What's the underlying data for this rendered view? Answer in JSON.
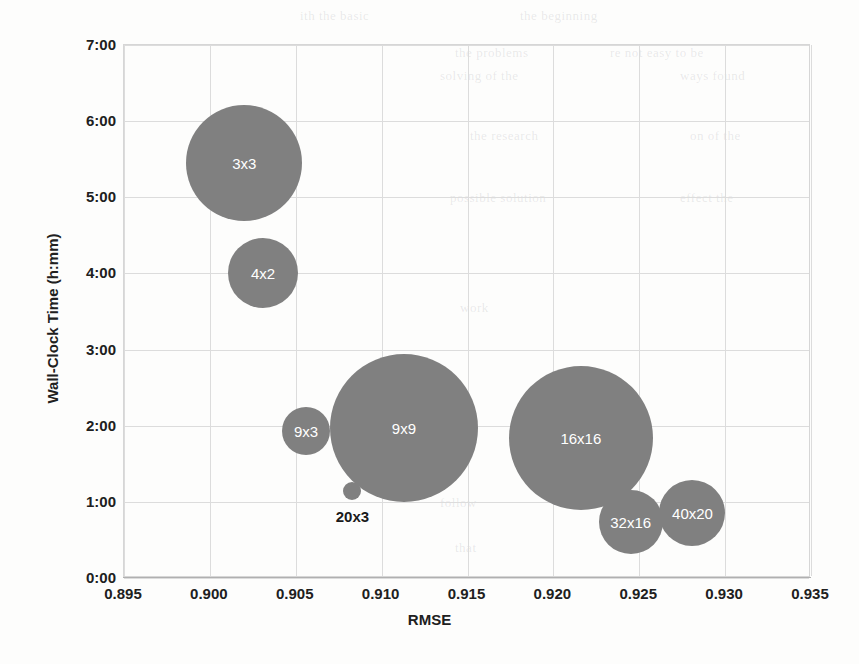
{
  "chart_data": {
    "type": "scatter",
    "subtype": "bubble",
    "title": "",
    "xlabel": "RMSE",
    "ylabel": "Wall-Clock Time (h:mm)",
    "xlim": [
      0.895,
      0.935
    ],
    "ylim": [
      0,
      7
    ],
    "xticks": [
      "0.895",
      "0.900",
      "0.905",
      "0.910",
      "0.915",
      "0.920",
      "0.925",
      "0.930",
      "0.935"
    ],
    "xtick_values": [
      0.895,
      0.9,
      0.905,
      0.91,
      0.915,
      0.92,
      0.925,
      0.93,
      0.935
    ],
    "yticks": [
      "0:00",
      "1:00",
      "2:00",
      "3:00",
      "4:00",
      "5:00",
      "6:00",
      "7:00"
    ],
    "ytick_values": [
      0,
      1,
      2,
      3,
      4,
      5,
      6,
      7
    ],
    "grid": true,
    "legend": "none",
    "bubble_color": "#808080",
    "points": [
      {
        "label": "3x3",
        "x": 0.902,
        "y": 5.45,
        "y_time": "5:27",
        "r": 58,
        "label_pos": "inside"
      },
      {
        "label": "4x2",
        "x": 0.9031,
        "y": 4.01,
        "y_time": "4:01",
        "r": 35,
        "label_pos": "inside"
      },
      {
        "label": "9x3",
        "x": 0.9056,
        "y": 1.93,
        "y_time": "1:56",
        "r": 24,
        "label_pos": "inside"
      },
      {
        "label": "9x9",
        "x": 0.9113,
        "y": 1.97,
        "y_time": "1:58",
        "r": 74,
        "label_pos": "inside"
      },
      {
        "label": "20x3",
        "x": 0.9083,
        "y": 1.14,
        "y_time": "1:08",
        "r": 9,
        "label_pos": "below"
      },
      {
        "label": "16x16",
        "x": 0.9216,
        "y": 1.84,
        "y_time": "1:50",
        "r": 72,
        "label_pos": "inside"
      },
      {
        "label": "32x16",
        "x": 0.9245,
        "y": 0.74,
        "y_time": "0:44",
        "r": 32,
        "label_pos": "inside"
      },
      {
        "label": "40x20",
        "x": 0.9281,
        "y": 0.86,
        "y_time": "0:52",
        "r": 33,
        "label_pos": "inside"
      }
    ]
  },
  "bleed_text": [
    {
      "t": "the beginning",
      "x": 520,
      "y": 8
    },
    {
      "t": "ith the basic",
      "x": 300,
      "y": 8
    },
    {
      "t": "the problems",
      "x": 455,
      "y": 45
    },
    {
      "t": "re not easy to be",
      "x": 610,
      "y": 45
    },
    {
      "t": "solving of the",
      "x": 440,
      "y": 68
    },
    {
      "t": "ways found",
      "x": 680,
      "y": 68
    },
    {
      "t": "the research",
      "x": 470,
      "y": 128
    },
    {
      "t": "on of the",
      "x": 690,
      "y": 128
    },
    {
      "t": "possible solution",
      "x": 450,
      "y": 190
    },
    {
      "t": "effect the",
      "x": 680,
      "y": 190
    },
    {
      "t": "work",
      "x": 460,
      "y": 300
    },
    {
      "t": "follow",
      "x": 440,
      "y": 495
    },
    {
      "t": "that",
      "x": 455,
      "y": 540
    }
  ]
}
